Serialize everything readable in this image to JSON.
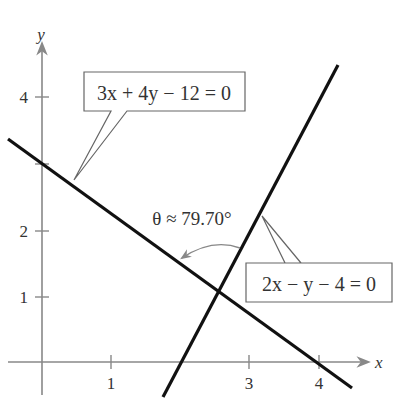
{
  "figure": {
    "type": "two intersecting lines with angle",
    "axes": {
      "x_label": "x",
      "y_label": "y",
      "x_ticks": [
        "1",
        "3",
        "4"
      ],
      "y_ticks": [
        "1",
        "2",
        "4"
      ]
    },
    "lines": [
      {
        "equation": "3x + 4y − 12 = 0",
        "label": "3x + 4y − 12 = 0"
      },
      {
        "equation": "2x − y − 4 = 0",
        "label": "2x − y − 4 = 0"
      }
    ],
    "angle_label": "θ ≈ 79.70°"
  },
  "colors": {
    "axis": "#888888",
    "line": "#111111",
    "callout_border": "#666666",
    "arc": "#888888",
    "text": "#333333"
  }
}
